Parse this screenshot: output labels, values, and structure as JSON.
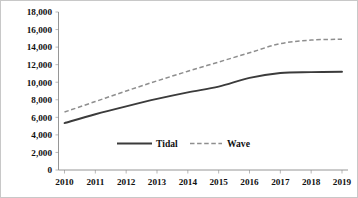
{
  "chart_data": {
    "type": "line",
    "title": "",
    "subtitle": "",
    "xlabel": "",
    "ylabel": "",
    "categories": [
      "2010",
      "2011",
      "2012",
      "2013",
      "2014",
      "2015",
      "2016",
      "2017",
      "2018",
      "2019"
    ],
    "x": [
      2010,
      2011,
      2012,
      2013,
      2014,
      2015,
      2016,
      2017,
      2018,
      2019
    ],
    "series": [
      {
        "name": "Tidal",
        "style": "solid",
        "color": "#3b3b3b",
        "values": [
          5350,
          6350,
          7250,
          8100,
          8850,
          9500,
          10500,
          11050,
          11150,
          11200
        ]
      },
      {
        "name": "Wave",
        "style": "dashed",
        "color": "#8e8e8e",
        "values": [
          6600,
          7800,
          9000,
          10150,
          11250,
          12300,
          13350,
          14400,
          14800,
          14900
        ]
      }
    ],
    "ylim": [
      0,
      18000
    ],
    "yticks": [
      0,
      2000,
      4000,
      6000,
      8000,
      10000,
      12000,
      14000,
      16000,
      18000
    ],
    "ytick_labels": [
      "0",
      "2,000",
      "4,000",
      "6,000",
      "8,000",
      "10,000",
      "12,000",
      "14,000",
      "16,000",
      "18,000"
    ],
    "xtick_labels": [
      "2010",
      "2011",
      "2012",
      "2013",
      "2014",
      "2015",
      "2016",
      "2017",
      "2018",
      "2019"
    ],
    "grid": false,
    "legend": {
      "position": "inside-bottom-center",
      "entries": [
        {
          "label": "Tidal",
          "style": "solid",
          "color": "#3b3b3b"
        },
        {
          "label": "Wave",
          "style": "dashed",
          "color": "#8e8e8e"
        }
      ]
    },
    "colors": {
      "tidal": "#3b3b3b",
      "wave": "#8e8e8e",
      "axis": "#8a8a8a",
      "text": "#111111",
      "background": "#ffffff"
    }
  }
}
